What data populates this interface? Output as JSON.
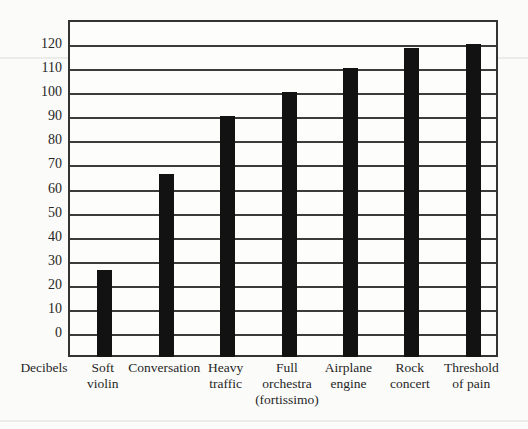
{
  "page": {
    "background_color": "#fbfbf9",
    "paper_color": "#fdfdfc",
    "line_color": "#3c3c3c",
    "bar_color": "#121212",
    "text_color": "#262626"
  },
  "axis": {
    "decibels_label": "Decibels"
  },
  "chart_data": {
    "type": "bar",
    "title": "",
    "xlabel": "",
    "ylabel": "Decibels",
    "categories": [
      {
        "label": "Soft violin",
        "lines": [
          "Soft",
          "violin"
        ]
      },
      {
        "label": "Conversation",
        "lines": [
          "Conversation"
        ]
      },
      {
        "label": "Heavy traffic",
        "lines": [
          "Heavy",
          "traffic"
        ]
      },
      {
        "label": "Full orchestra (fortissimo)",
        "lines": [
          "Full",
          "orchestra",
          "(fortissimo)"
        ]
      },
      {
        "label": "Airplane engine",
        "lines": [
          "Airplane",
          "engine"
        ]
      },
      {
        "label": "Rock concert",
        "lines": [
          "Rock",
          "concert"
        ]
      },
      {
        "label": "Threshold of pain",
        "lines": [
          "Threshold",
          "of pain"
        ]
      }
    ],
    "values": [
      27,
      67,
      91,
      101,
      111,
      119,
      121
    ],
    "yticks": [
      0,
      10,
      20,
      30,
      40,
      50,
      60,
      70,
      80,
      90,
      100,
      110,
      120
    ],
    "ylim": [
      -10,
      130
    ],
    "grid": true,
    "legend": false,
    "bars_extend_to_plot_bottom": true
  }
}
